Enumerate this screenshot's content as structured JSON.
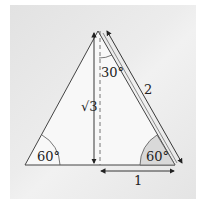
{
  "figure": {
    "labels": {
      "top_angle": "30°",
      "left_angle": "60°",
      "right_angle": "60°",
      "height": "√3",
      "hypotenuse": "2",
      "base_half": "1"
    },
    "colors": {
      "panel": "#e8e8e8",
      "triangle_fill": "#f7f7f7",
      "stroke": "#333333",
      "shaded_angle": "#d8d8d8"
    }
  }
}
